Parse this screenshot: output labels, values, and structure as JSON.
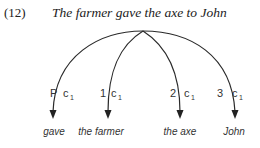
{
  "example": {
    "number": "(12)",
    "sentence": "The farmer gave the axe to John"
  },
  "arcs": [
    {
      "label": "P",
      "sub": "1",
      "case": "c",
      "target": "gave"
    },
    {
      "label": "1",
      "sub": "1",
      "case": "c",
      "target": "the farmer"
    },
    {
      "label": "2",
      "sub": "1",
      "case": "c",
      "target": "the axe"
    },
    {
      "label": "3",
      "sub": "1",
      "case": "c",
      "target": "John"
    }
  ]
}
